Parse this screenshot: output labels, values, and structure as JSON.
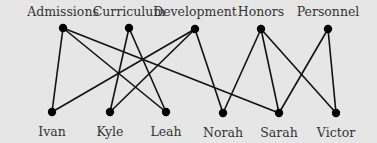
{
  "diagram": {
    "type": "bipartite-graph",
    "background": "#e6e6e6",
    "edge_color": "#111111",
    "top_nodes": [
      {
        "id": "admissions",
        "label": "Admissions",
        "x": 63,
        "y": 28
      },
      {
        "id": "curriculum",
        "label": "Curriculum",
        "x": 129,
        "y": 28
      },
      {
        "id": "development",
        "label": "Development",
        "x": 195,
        "y": 29
      },
      {
        "id": "honors",
        "label": "Honors",
        "x": 261,
        "y": 29
      },
      {
        "id": "personnel",
        "label": "Personnel",
        "x": 328,
        "y": 29
      }
    ],
    "bottom_nodes": [
      {
        "id": "ivan",
        "label": "Ivan",
        "x": 52,
        "y": 112
      },
      {
        "id": "kyle",
        "label": "Kyle",
        "x": 110,
        "y": 112
      },
      {
        "id": "leah",
        "label": "Leah",
        "x": 166,
        "y": 112
      },
      {
        "id": "norah",
        "label": "Norah",
        "x": 223,
        "y": 113
      },
      {
        "id": "sarah",
        "label": "Sarah",
        "x": 279,
        "y": 113
      },
      {
        "id": "victor",
        "label": "Victor",
        "x": 336,
        "y": 113
      }
    ],
    "edges": [
      [
        "admissions",
        "ivan"
      ],
      [
        "admissions",
        "leah"
      ],
      [
        "admissions",
        "sarah"
      ],
      [
        "curriculum",
        "kyle"
      ],
      [
        "curriculum",
        "leah"
      ],
      [
        "development",
        "ivan"
      ],
      [
        "development",
        "kyle"
      ],
      [
        "development",
        "norah"
      ],
      [
        "honors",
        "norah"
      ],
      [
        "honors",
        "sarah"
      ],
      [
        "honors",
        "victor"
      ],
      [
        "personnel",
        "sarah"
      ],
      [
        "personnel",
        "victor"
      ]
    ]
  }
}
